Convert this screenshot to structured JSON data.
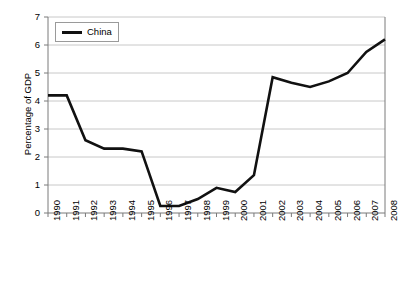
{
  "chart_data": {
    "type": "line",
    "title": "",
    "xlabel": "",
    "ylabel": "Percentage of GDP",
    "ylim": [
      0,
      7
    ],
    "yticks": [
      "0",
      "1",
      "2",
      "3",
      "4",
      "5",
      "6",
      "7"
    ],
    "grid": true,
    "legend_position": "top-left",
    "categories": [
      "1990",
      "1991",
      "1992",
      "1993",
      "1994",
      "1995",
      "1996",
      "1997",
      "1998",
      "1999",
      "2000",
      "2001",
      "2002",
      "2003",
      "2004",
      "2005",
      "2006",
      "2007",
      "2008"
    ],
    "series": [
      {
        "name": "China",
        "color": "#111111",
        "values": [
          4.2,
          4.2,
          2.6,
          2.3,
          2.3,
          2.2,
          0.25,
          0.25,
          0.5,
          0.9,
          0.75,
          1.35,
          4.85,
          4.65,
          4.5,
          4.7,
          5.0,
          5.75,
          6.2
        ]
      }
    ]
  },
  "legend": {
    "entries": [
      {
        "label": "China"
      }
    ]
  },
  "axes": {
    "y_title": "Percentage of GDP"
  },
  "colors": {
    "series_line": "#111111",
    "grid": "#c8c8c8",
    "axis": "#7a7a7a",
    "plot_background": "#ffffff"
  }
}
